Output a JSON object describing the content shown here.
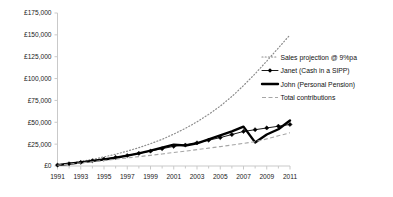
{
  "chart_data": {
    "type": "line",
    "title": "",
    "xlabel": "",
    "ylabel": "",
    "xlim": [
      1991,
      2011
    ],
    "ylim": [
      0,
      175000
    ],
    "grid": false,
    "legend_position": "right",
    "x": [
      1991,
      1992,
      1993,
      1994,
      1995,
      1996,
      1997,
      1998,
      1999,
      2000,
      2001,
      2002,
      2003,
      2004,
      2005,
      2006,
      2007,
      2008,
      2009,
      2010,
      2011
    ],
    "y_ticks": [
      0,
      25000,
      50000,
      75000,
      100000,
      125000,
      150000,
      175000
    ],
    "y_tick_labels": [
      "£0",
      "£25,000",
      "£50,000",
      "£75,000",
      "£100,000",
      "£125,000",
      "£150,000",
      "£175,000"
    ],
    "x_ticks": [
      1991,
      1993,
      1995,
      1997,
      1999,
      2001,
      2003,
      2005,
      2007,
      2009,
      2011
    ],
    "x_tick_labels": [
      "1991",
      "1993",
      "1995",
      "1997",
      "1999",
      "2001",
      "2003",
      "2005",
      "2007",
      "2009",
      "2011"
    ],
    "x_minor_ticks": [
      1992,
      1994,
      1996,
      1998,
      2000,
      2002,
      2004,
      2006,
      2008,
      2010
    ],
    "series": [
      {
        "name": "Sales projection @ 9%pa",
        "style": "dotted",
        "color": "#8c8c8c",
        "marker": "none",
        "values": [
          1200,
          3000,
          5200,
          7600,
          10400,
          13500,
          17000,
          21000,
          25500,
          30500,
          36500,
          43000,
          50500,
          59000,
          68500,
          79500,
          92000,
          105500,
          120000,
          135000,
          150000
        ]
      },
      {
        "name": "Janet (Cash in a SIPP)",
        "style": "solid-thin",
        "color": "#000000",
        "marker": "diamond",
        "values": [
          1100,
          2600,
          4200,
          6000,
          7800,
          9800,
          12000,
          14500,
          17000,
          19800,
          22500,
          24000,
          26500,
          29500,
          32500,
          36000,
          39500,
          41500,
          43500,
          45500,
          47500
        ]
      },
      {
        "name": "John (Personal Pension)",
        "style": "solid-thick",
        "color": "#000000",
        "marker": "none",
        "values": [
          1000,
          2500,
          4100,
          5800,
          7500,
          9500,
          11800,
          14500,
          17500,
          21000,
          24500,
          23500,
          26000,
          30500,
          35000,
          39500,
          45000,
          27000,
          36000,
          42000,
          52000
        ]
      },
      {
        "name": "Total contributions",
        "style": "dashed",
        "color": "#a6a6a6",
        "marker": "none",
        "values": [
          900,
          2200,
          3500,
          4900,
          6300,
          7700,
          9200,
          10700,
          12200,
          13800,
          15400,
          17000,
          18700,
          20400,
          22200,
          24000,
          25900,
          27800,
          31000,
          34500,
          38000
        ]
      }
    ]
  },
  "legend": {
    "items": [
      {
        "label": "Sales projection @ 9%pa"
      },
      {
        "label": "Janet (Cash in a SIPP)"
      },
      {
        "label": "John (Personal Pension)"
      },
      {
        "label": "Total contributions"
      }
    ]
  }
}
